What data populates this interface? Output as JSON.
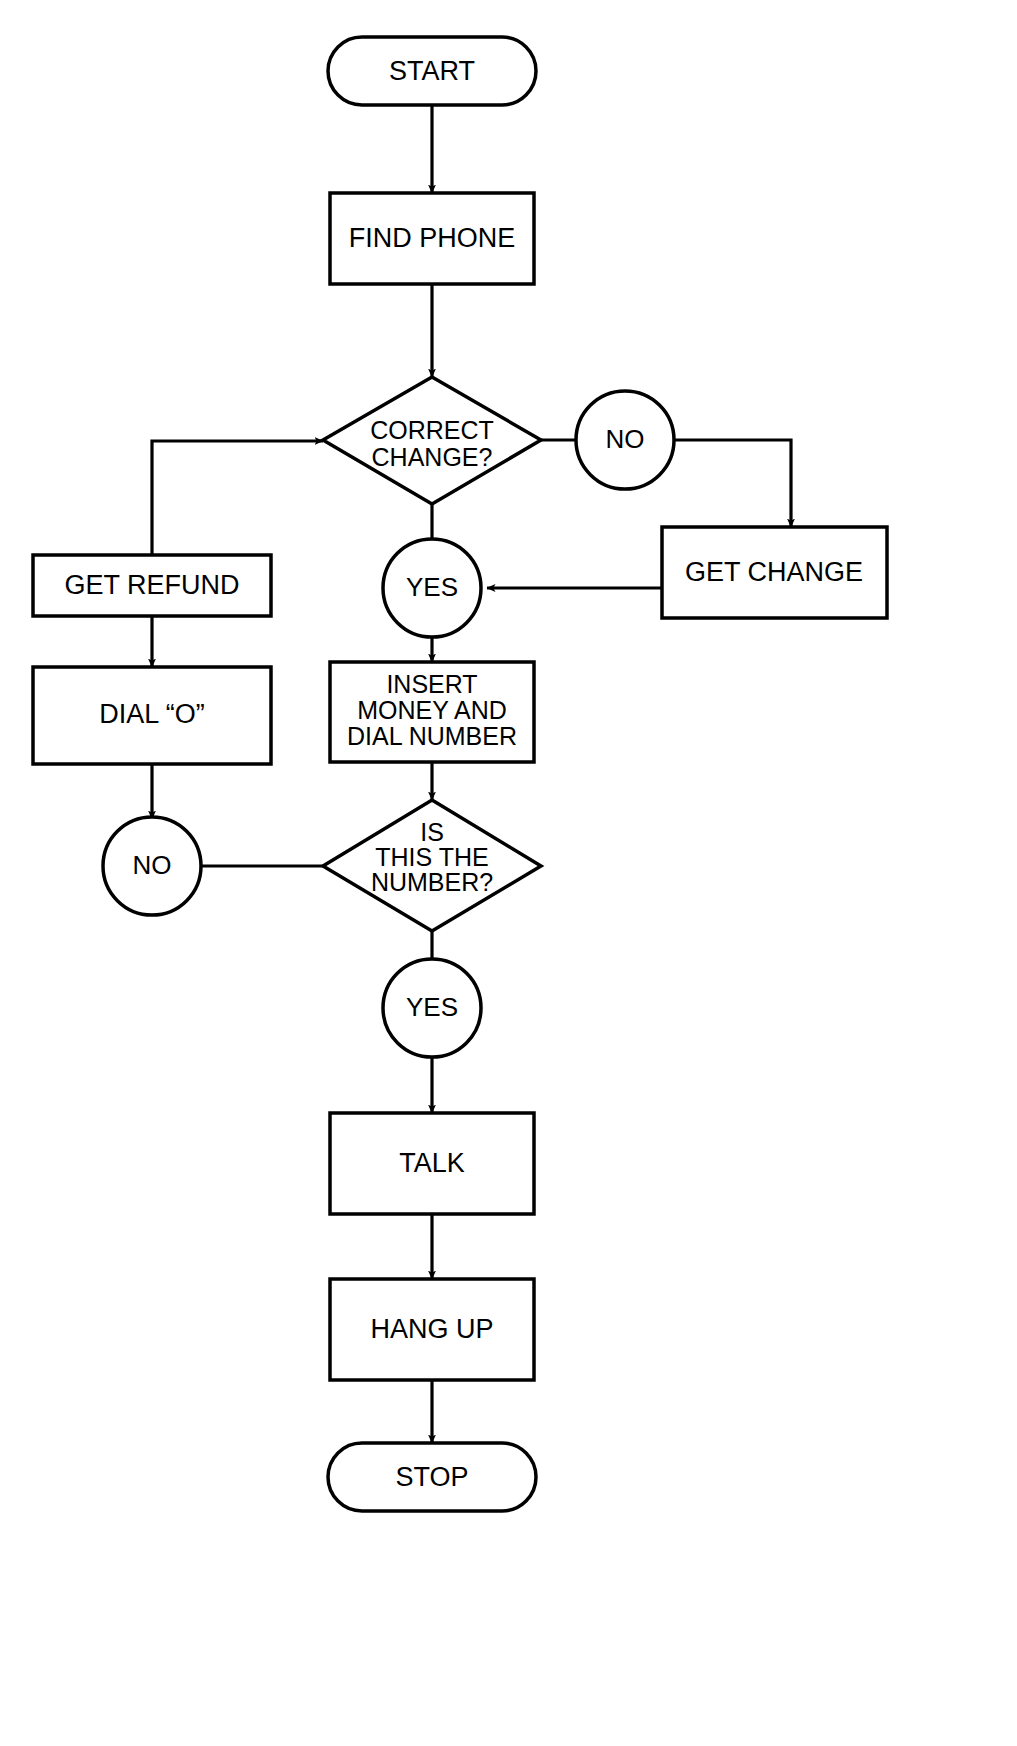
{
  "diagram": {
    "background_color": "#ffffff",
    "line_color": "#000000",
    "text_color": "#000000"
  },
  "nodes": {
    "start": {
      "label": "START",
      "shape": "terminator"
    },
    "find_phone": {
      "label": "FIND PHONE",
      "shape": "process"
    },
    "correct_change": {
      "label_line1": "CORRECT",
      "label_line2": "CHANGE?",
      "shape": "decision"
    },
    "no_change": {
      "label": "NO",
      "shape": "connector"
    },
    "get_change": {
      "label": "GET CHANGE",
      "shape": "process"
    },
    "yes_change": {
      "label": "YES",
      "shape": "connector"
    },
    "get_refund": {
      "label": "GET REFUND",
      "shape": "process"
    },
    "dial_o": {
      "label": "DIAL “O”",
      "shape": "process"
    },
    "insert_money": {
      "label_line1": "INSERT",
      "label_line2": "MONEY AND",
      "label_line3": "DIAL NUMBER",
      "shape": "process"
    },
    "is_this_number": {
      "label_line1": "IS",
      "label_line2": "THIS THE",
      "label_line3": "NUMBER?",
      "shape": "decision"
    },
    "no_number": {
      "label": "NO",
      "shape": "connector"
    },
    "yes_number": {
      "label": "YES",
      "shape": "connector"
    },
    "talk": {
      "label": "TALK",
      "shape": "process"
    },
    "hang_up": {
      "label": "HANG UP",
      "shape": "process"
    },
    "stop": {
      "label": "STOP",
      "shape": "terminator"
    }
  },
  "edges": [
    {
      "from": "start",
      "to": "find_phone",
      "label": ""
    },
    {
      "from": "find_phone",
      "to": "correct_change",
      "label": ""
    },
    {
      "from": "correct_change",
      "to": "no_change",
      "label": "NO"
    },
    {
      "from": "no_change",
      "to": "get_change",
      "label": ""
    },
    {
      "from": "get_change",
      "to": "yes_change",
      "label": ""
    },
    {
      "from": "correct_change",
      "to": "yes_change",
      "label": "YES"
    },
    {
      "from": "yes_change",
      "to": "insert_money",
      "label": ""
    },
    {
      "from": "get_refund",
      "to": "correct_change",
      "label": ""
    },
    {
      "from": "get_refund",
      "to": "dial_o",
      "label": ""
    },
    {
      "from": "dial_o",
      "to": "no_number",
      "label": ""
    },
    {
      "from": "no_number",
      "to": "is_this_number",
      "label": ""
    },
    {
      "from": "insert_money",
      "to": "is_this_number",
      "label": ""
    },
    {
      "from": "is_this_number",
      "to": "yes_number",
      "label": "YES"
    },
    {
      "from": "yes_number",
      "to": "talk",
      "label": ""
    },
    {
      "from": "talk",
      "to": "hang_up",
      "label": ""
    },
    {
      "from": "hang_up",
      "to": "stop",
      "label": ""
    }
  ]
}
